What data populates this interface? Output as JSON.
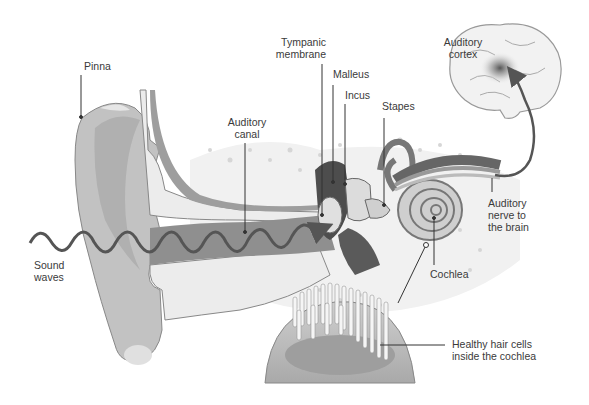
{
  "diagram": {
    "labels": {
      "pinna": "Pinna",
      "auditory_canal_1": "Auditory",
      "auditory_canal_2": "canal",
      "tympanic_1": "Tympanic",
      "tympanic_2": "membrane",
      "malleus": "Malleus",
      "incus": "Incus",
      "stapes": "Stapes",
      "auditory_cortex_1": "Auditory",
      "auditory_cortex_2": "cortex",
      "auditory_nerve_1": "Auditory",
      "auditory_nerve_2": "nerve to",
      "auditory_nerve_3": "the brain",
      "cochlea": "Cochlea",
      "sound_waves_1": "Sound",
      "sound_waves_2": "waves",
      "hair_cells_1": "Healthy hair cells",
      "hair_cells_2": "inside the cochlea"
    },
    "colors": {
      "background": "#ffffff",
      "skin": "#bdbdbd",
      "skin_dark": "#9a9a9a",
      "canal": "#8f8f8f",
      "bone": "#e6e6e6",
      "wave": "#555555",
      "leader": "#333333",
      "text": "#3a3a3a"
    }
  }
}
